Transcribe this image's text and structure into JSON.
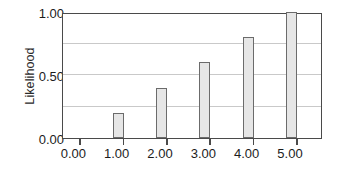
{
  "chart_data": {
    "type": "bar",
    "title": "",
    "subtitle": "",
    "xlabel": "",
    "ylabel": "Likelihood",
    "categories": [
      "0.00",
      "1.00",
      "2.00",
      "3.00",
      "4.00",
      "5.00"
    ],
    "x": [
      0,
      1,
      2,
      3,
      4,
      5
    ],
    "values": [
      0.0,
      0.2,
      0.4,
      0.6,
      0.8,
      1.0
    ],
    "series": [
      {
        "name": "Likelihood",
        "values": [
          0.0,
          0.2,
          0.4,
          0.6,
          0.8,
          1.0
        ]
      }
    ],
    "xlim": [
      -0.4,
      5.6
    ],
    "ylim": [
      0.0,
      1.0
    ],
    "yticks": [
      0.0,
      0.5,
      1.0
    ],
    "ytick_labels": [
      "0.00",
      "0.50",
      "1.00"
    ],
    "xticks": [
      0,
      1,
      2,
      3,
      4,
      5
    ],
    "xtick_labels": [
      "0.00",
      "1.00",
      "2.00",
      "3.00",
      "4.00",
      "5.00"
    ],
    "gridlines_y": [
      0.25,
      0.5,
      0.75
    ],
    "grid": true,
    "grid_axis": "y",
    "legend": false,
    "legend_position": "none",
    "bar_fill_color": "#e6e6e6",
    "bar_edge_color": "#6b6b6b",
    "grid_color": "#c9c9c9",
    "axis_color": "#4a4a4a",
    "text_color": "#1c1c1c",
    "background_color": "#ffffff",
    "annotations": []
  },
  "axes": {
    "y_title": "Likelihood",
    "y_labels": {
      "top": "1.00",
      "middle": "0.50",
      "bottom": "0.00"
    },
    "x_labels": [
      "0.00",
      "1.00",
      "2.00",
      "3.00",
      "4.00",
      "5.00"
    ]
  }
}
